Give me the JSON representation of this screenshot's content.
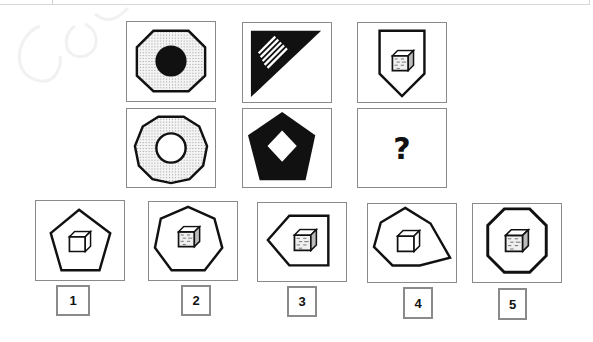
{
  "puzzle": {
    "matrix": {
      "rows": [
        [
          {
            "id": "r1c1",
            "description": "octagon, dotted fill, black filled circle inside"
          },
          {
            "id": "r1c2",
            "description": "black right triangle with white diagonal stripes"
          },
          {
            "id": "r1c3",
            "description": "shield/pentagon outline containing dotted cube"
          }
        ],
        [
          {
            "id": "r2c1",
            "description": "decagon, dotted fill, white circle inside"
          },
          {
            "id": "r2c2",
            "description": "black filled pentagon with white diamond inside"
          },
          {
            "id": "r2c3",
            "description": "missing cell",
            "symbol": "?"
          }
        ]
      ]
    },
    "options": [
      {
        "label": "1",
        "description": "pentagon outline with white cube"
      },
      {
        "label": "2",
        "description": "heptagon outline with dotted cube"
      },
      {
        "label": "3",
        "description": "arrow-pentagon pointing left with dotted cube"
      },
      {
        "label": "4",
        "description": "irregular hexagon outline with white cube"
      },
      {
        "label": "5",
        "description": "octagon outline with dotted cube"
      }
    ]
  },
  "colors": {
    "frame": "#8a8a8a",
    "ink": "#111111",
    "dot": "#9a9a9a"
  }
}
